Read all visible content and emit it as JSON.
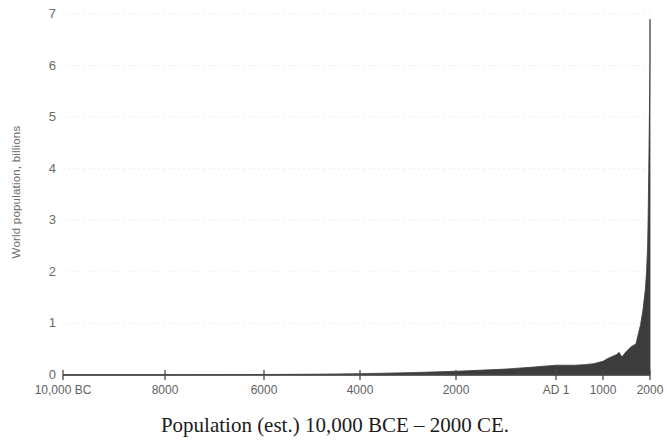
{
  "chart_data": {
    "type": "area",
    "title": "Population (est.) 10,000 BCE – 2000 CE.",
    "xlabel": "",
    "ylabel": "World population, billions",
    "grid": true,
    "legend": null,
    "xlim": [
      -10000,
      2000
    ],
    "ylim": [
      0,
      7
    ],
    "yticks": [
      0,
      1,
      2,
      3,
      4,
      5,
      6,
      7
    ],
    "ytick_labels": [
      "0",
      "1",
      "2",
      "3",
      "4",
      "5",
      "6",
      "7"
    ],
    "xticks": [
      -10000,
      -8000,
      -6000,
      -4000,
      -2000,
      1,
      1000,
      2000
    ],
    "xtick_labels": [
      "10,000 BC",
      "8000",
      "6000",
      "4000",
      "2000",
      "AD 1",
      "1000",
      "2000"
    ],
    "x_axis_note": "Non-linear spacing: 10,000 BC to 2000 BC evenly spaced, then AD 1, 1000 and 2000 compressed at right",
    "series": [
      {
        "name": "World population",
        "units": "billions",
        "x": [
          -10000,
          -9000,
          -8000,
          -7000,
          -6000,
          -5000,
          -4000,
          -3000,
          -2000,
          -1000,
          -500,
          1,
          200,
          400,
          600,
          800,
          1000,
          1100,
          1200,
          1300,
          1340,
          1400,
          1500,
          1600,
          1700,
          1750,
          1800,
          1850,
          1900,
          1927,
          1950,
          1960,
          1974,
          1987,
          1999,
          2000
        ],
        "values": [
          0.004,
          0.005,
          0.005,
          0.007,
          0.01,
          0.015,
          0.025,
          0.045,
          0.072,
          0.115,
          0.15,
          0.19,
          0.19,
          0.19,
          0.2,
          0.22,
          0.265,
          0.32,
          0.36,
          0.4,
          0.44,
          0.35,
          0.46,
          0.55,
          0.6,
          0.79,
          0.98,
          1.26,
          1.65,
          2.0,
          2.52,
          3.02,
          4.0,
          5.0,
          6.0,
          6.9
        ]
      }
    ],
    "colors": {
      "area_fill": "#3c3c3c",
      "axis": "#4a4a4a",
      "grid": "#eeeeee",
      "tick_label": "#6a6a6a",
      "title": "#1b1b1b",
      "background": "#ffffff"
    }
  },
  "axis": {
    "y_title": "World population, billions"
  },
  "title": {
    "text": "Population (est.) 10,000 BCE – 2000 CE."
  }
}
